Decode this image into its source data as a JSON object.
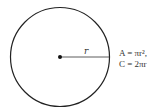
{
  "diagram": {
    "radius_label": "r",
    "formulas": [
      "A = πr²,",
      "C = 2πr"
    ],
    "colors": {
      "stroke": "#222222",
      "text": "#333333"
    }
  }
}
